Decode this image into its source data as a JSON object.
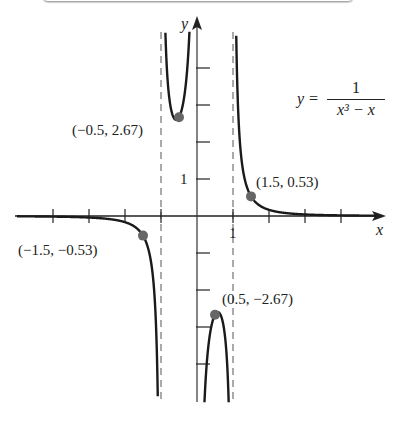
{
  "chart_data": {
    "type": "line",
    "title": "",
    "equation": {
      "lhs": "y =",
      "numerator": "1",
      "denominator": "x³ − x"
    },
    "xlabel": "x",
    "ylabel": "y",
    "xlim": [
      -4.4,
      5.1
    ],
    "ylim": [
      -5.1,
      5.4
    ],
    "x_ticks": [
      -4,
      -3,
      -2,
      -1,
      1,
      2,
      3,
      4
    ],
    "y_ticks": [
      -4,
      -3,
      -2,
      -1,
      1,
      2,
      3,
      4
    ],
    "tick_labels": {
      "x": "1",
      "y": "1"
    },
    "vertical_asymptotes": [
      -1,
      1
    ],
    "horizontal_asymptote": 0,
    "grid": false,
    "series": [
      {
        "name": "y = 1/(x^3 - x)",
        "function": "1/(x^3-x)"
      }
    ],
    "points": [
      {
        "x": -0.5,
        "y": 2.67,
        "label": "(−0.5, 2.67)"
      },
      {
        "x": 1.5,
        "y": 0.53,
        "label": "(1.5, 0.53)"
      },
      {
        "x": -1.5,
        "y": -0.53,
        "label": "(−1.5, −0.53)"
      },
      {
        "x": 0.5,
        "y": -2.67,
        "label": "(0.5, −2.67)"
      }
    ],
    "colors": {
      "curve": "#1a1a1a",
      "point": "#666666",
      "asymptote": "#555555"
    }
  }
}
